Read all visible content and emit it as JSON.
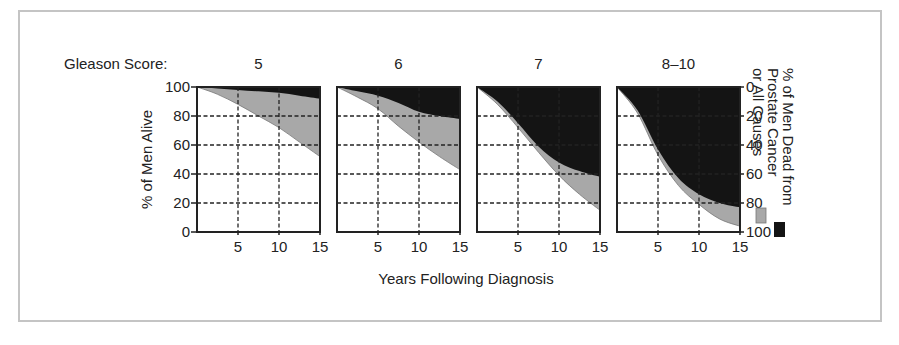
{
  "chart_data": {
    "type": "area",
    "title_label": "Gleason Score:",
    "xlabel": "Years Following Diagnosis",
    "ylabel_left": "% of Men Alive",
    "ylabel_right": "% of Men Dead from Prostate Cancer or All Causes",
    "legend": [
      {
        "name": "Prostate Cancer",
        "color": "#141414"
      },
      {
        "name": "All Causes",
        "color": "#a8a8a8"
      }
    ],
    "legend_lines": [
      "% of Men Dead from",
      "Prostate Cancer",
      "or All Causes"
    ],
    "x_ticks": [
      "5",
      "10",
      "15"
    ],
    "x_tick_values": [
      5,
      10,
      15
    ],
    "y_ticks_left": [
      "0",
      "20",
      "40",
      "60",
      "80",
      "100"
    ],
    "y_ticks_right": [
      "0",
      "20",
      "40",
      "60",
      "80",
      "100"
    ],
    "xlim": [
      0,
      15
    ],
    "ylim": [
      0,
      100
    ],
    "grid": "dashed",
    "x": [
      0,
      2.5,
      5,
      7.5,
      10,
      12.5,
      15
    ],
    "panels": [
      {
        "label": "5",
        "prostate_cancer_boundary": [
          100,
          99,
          98,
          97,
          96,
          94,
          92
        ],
        "all_causes_boundary": [
          100,
          95,
          88,
          80,
          72,
          62,
          52
        ]
      },
      {
        "label": "6",
        "prostate_cancer_boundary": [
          100,
          97,
          94,
          89,
          83,
          80,
          78
        ],
        "all_causes_boundary": [
          100,
          93,
          85,
          73,
          62,
          52,
          43
        ]
      },
      {
        "label": "7",
        "prostate_cancer_boundary": [
          100,
          90,
          75,
          59,
          48,
          42,
          38
        ],
        "all_causes_boundary": [
          100,
          88,
          72,
          55,
          39,
          26,
          15
        ]
      },
      {
        "label": "8–10",
        "prostate_cancer_boundary": [
          100,
          84,
          57,
          37,
          26,
          20,
          17
        ],
        "all_causes_boundary": [
          100,
          82,
          53,
          32,
          19,
          9,
          4
        ]
      }
    ]
  }
}
